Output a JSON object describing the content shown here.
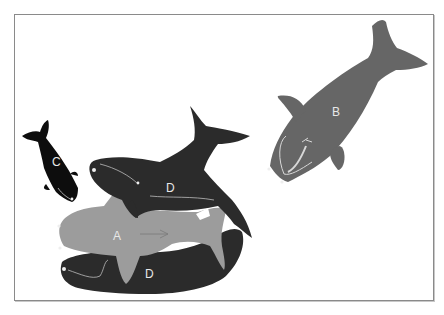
{
  "diagram": {
    "colors": {
      "whale_a": "#9c9c9c",
      "whale_b": "#666666",
      "whale_c": "#0d0d0d",
      "whale_d": "#2b2b2b",
      "label": "#e8e8e8",
      "frame_border": "#8a8a8a"
    },
    "whales": [
      {
        "id": "A",
        "label": "A"
      },
      {
        "id": "B",
        "label": "B"
      },
      {
        "id": "C",
        "label": "C"
      },
      {
        "id": "D-upper",
        "label": "D"
      },
      {
        "id": "D-lower",
        "label": "D"
      }
    ]
  }
}
